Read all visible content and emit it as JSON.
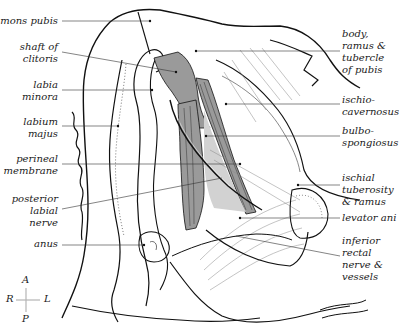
{
  "figure": {
    "colors": {
      "muscle_dark": "#9a9a9a",
      "muscle_light": "#d2d2d2",
      "line": "#111111",
      "leader": "#333333",
      "compass": "#b5b5b5"
    },
    "labels_left": [
      {
        "id": "mons-pubis",
        "text": "mons pubis"
      },
      {
        "id": "shaft-of-clitoris",
        "text": "shaft of\nclitoris"
      },
      {
        "id": "labia-minora",
        "text": "labia\nminora"
      },
      {
        "id": "labium-majus",
        "text": "labium\nmajus"
      },
      {
        "id": "perineal-membrane",
        "text": "perineal\nmembrane"
      },
      {
        "id": "posterior-labial-nerve",
        "text": "posterior\nlabial\nnerve"
      },
      {
        "id": "anus",
        "text": "anus"
      }
    ],
    "labels_right": [
      {
        "id": "body-ramus-tubercle-of-pubis",
        "text": "body,\nramus &\ntubercle\nof pubis"
      },
      {
        "id": "ischiocavernosus",
        "text": "ischio-\ncavernosus"
      },
      {
        "id": "bulbospongiosus",
        "text": "bulbo-\nspongiosus"
      },
      {
        "id": "ischial-tuberosity-ramus",
        "text": "ischial\ntuberosity\n& ramus"
      },
      {
        "id": "levator-ani",
        "text": "levator ani"
      },
      {
        "id": "inferior-rectal-nerve-vessels",
        "text": "inferior\nrectal\nnerve &\nvessels"
      }
    ],
    "compass": {
      "top": "A",
      "left": "R",
      "right": "L",
      "bottom": "P"
    }
  }
}
